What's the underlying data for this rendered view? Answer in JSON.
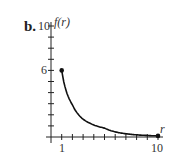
{
  "part_label": "b.",
  "chart_data": {
    "type": "line",
    "title": "",
    "xlabel": "r",
    "ylabel": "f(r)",
    "xlim": [
      0,
      10
    ],
    "ylim": [
      0,
      10
    ],
    "x_tick_labels": [
      "1",
      "10"
    ],
    "y_tick_labels": [
      "6",
      "10"
    ],
    "x_ticks": [
      1,
      2,
      3,
      4,
      5,
      6,
      7,
      8,
      9,
      10
    ],
    "y_ticks": [
      1,
      2,
      3,
      4,
      5,
      6,
      7,
      8,
      9,
      10
    ],
    "grid": false,
    "series": [
      {
        "name": "f(r)",
        "x": [
          1,
          2,
          3,
          5,
          10
        ],
        "y": [
          6,
          2.9,
          1.6,
          0.8,
          0.1
        ]
      }
    ],
    "endpoints": [
      [
        1,
        6
      ],
      [
        10,
        0.1
      ]
    ]
  }
}
